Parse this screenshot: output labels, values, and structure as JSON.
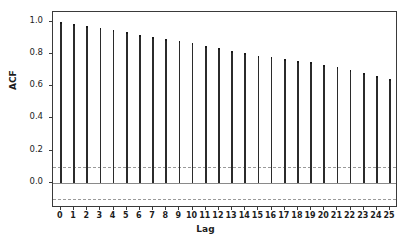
{
  "chart_data": {
    "type": "bar",
    "title": "",
    "subtitle": "",
    "xlabel": "Lag",
    "ylabel": "ACF",
    "xlim": [
      -0.6,
      25.6
    ],
    "ylim": [
      -0.155,
      1.06
    ],
    "grid": false,
    "legend": null,
    "categories": [
      0,
      1,
      2,
      3,
      4,
      5,
      6,
      7,
      8,
      9,
      10,
      11,
      12,
      13,
      14,
      15,
      16,
      17,
      18,
      19,
      20,
      21,
      22,
      23,
      24,
      25
    ],
    "values": [
      1.0,
      0.987,
      0.975,
      0.958,
      0.946,
      0.934,
      0.92,
      0.906,
      0.894,
      0.879,
      0.867,
      0.849,
      0.834,
      0.817,
      0.805,
      0.79,
      0.779,
      0.769,
      0.757,
      0.747,
      0.731,
      0.716,
      0.698,
      0.681,
      0.661,
      0.645
    ],
    "series": [
      {
        "name": "ACF",
        "values": [
          1.0,
          0.987,
          0.975,
          0.958,
          0.946,
          0.934,
          0.92,
          0.906,
          0.894,
          0.879,
          0.867,
          0.849,
          0.834,
          0.817,
          0.805,
          0.79,
          0.779,
          0.769,
          0.757,
          0.747,
          0.731,
          0.716,
          0.698,
          0.681,
          0.661,
          0.645
        ]
      }
    ],
    "confidence_bands": {
      "upper": 0.101,
      "lower": -0.101,
      "style": "dashed",
      "color": "#9a9a9a"
    },
    "zero_line": 0.0,
    "ytick_labels": [
      "1.0",
      "0.8",
      "0.6",
      "0.4",
      "0.2",
      "0.0"
    ],
    "ytick_values": [
      1.0,
      0.8,
      0.6,
      0.4,
      0.2,
      0.0
    ],
    "xtick_labels": [
      "0",
      "1",
      "2",
      "3",
      "4",
      "5",
      "6",
      "7",
      "8",
      "9",
      "10",
      "11",
      "12",
      "13",
      "14",
      "15",
      "16",
      "17",
      "18",
      "19",
      "20",
      "21",
      "22",
      "23",
      "24",
      "25"
    ],
    "colors": {
      "stem": "#2b2b2b",
      "zero_line": "#8a8a8a",
      "conf_band": "#9a9a9a",
      "frame": "#3a3a3a",
      "background": "#ffffff",
      "text": "#1d1d1d"
    }
  }
}
